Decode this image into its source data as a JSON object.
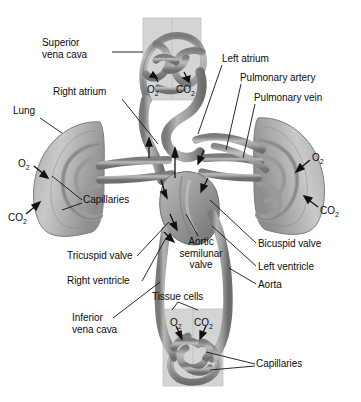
{
  "diagram": {
    "colors": {
      "vessel_mid": "#9a9a9a",
      "vessel_dark": "#6f6f6f",
      "vessel_light": "#c4c4c4",
      "tissue_block": "#d2d2d2",
      "lung_fill": "#b9b9b9",
      "lung_dark": "#8f8f8f",
      "outline": "#5a5a5a",
      "leader": "#1a1a1a",
      "text": "#0d0d0d",
      "background": "#ffffff"
    },
    "labels": {
      "superior_vena_cava": "Superior\nvena cava",
      "superior_vena_cava_l1": "Superior",
      "superior_vena_cava_l2": "vena cava",
      "right_atrium": "Right atrium",
      "lung_left": "Lung",
      "left_atrium": "Left atrium",
      "pulmonary_artery": "Pulmonary artery",
      "pulmonary_vein": "Pulmonary vein",
      "capillaries_lung": "Capillaries",
      "tricuspid_valve": "Tricuspid valve",
      "right_ventricle": "Right ventricle",
      "inferior_vena_cava_l1": "Inferior",
      "inferior_vena_cava_l2": "vena cava",
      "aortic_semilunar_valve_l1": "Aortic",
      "aortic_semilunar_valve_l2": "semilunar",
      "aortic_semilunar_valve_l3": "valve",
      "bicuspid_valve": "Bicuspid valve",
      "left_ventricle": "Left ventricle",
      "aorta": "Aorta",
      "tissue_cells": "Tissue cells",
      "capillaries_tissue": "Capillaries"
    },
    "gas_markers": {
      "o2": "O",
      "o2_sub": "2",
      "co2": "CO",
      "co2_sub": "2"
    },
    "gas_label_positions": [
      {
        "name": "top-capillary-o2",
        "gas": "O2",
        "x": 147,
        "y": 84
      },
      {
        "name": "top-capillary-co2",
        "gas": "CO2",
        "x": 176,
        "y": 84
      },
      {
        "name": "left-lung-o2",
        "gas": "O2",
        "x": 18,
        "y": 158
      },
      {
        "name": "left-lung-co2",
        "gas": "CO2",
        "x": 8,
        "y": 212
      },
      {
        "name": "right-lung-o2",
        "gas": "O2",
        "x": 312,
        "y": 152
      },
      {
        "name": "right-lung-co2",
        "gas": "CO2",
        "x": 320,
        "y": 205
      },
      {
        "name": "tissue-o2",
        "gas": "O2",
        "x": 170,
        "y": 317
      },
      {
        "name": "tissue-co2",
        "gas": "CO2",
        "x": 194,
        "y": 317
      }
    ]
  }
}
